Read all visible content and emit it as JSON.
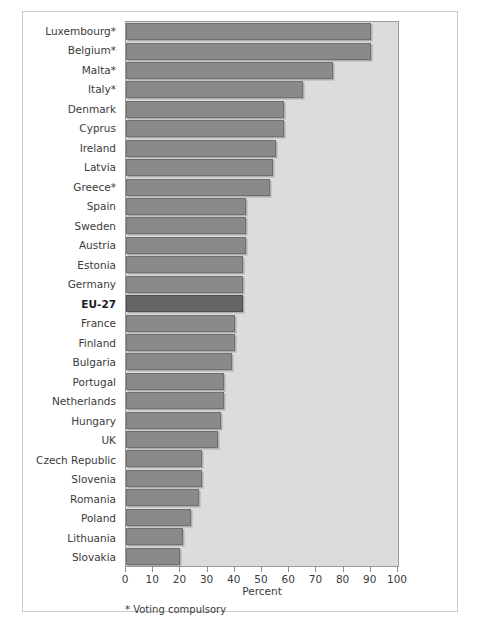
{
  "chart_data": {
    "type": "bar",
    "orientation": "horizontal",
    "title": "",
    "xlabel": "Percent",
    "ylabel": "",
    "xlim": [
      0,
      100
    ],
    "xticks": [
      0,
      10,
      20,
      30,
      40,
      50,
      60,
      70,
      80,
      90,
      100
    ],
    "grid": false,
    "legend": false,
    "footnote": "* Voting compulsory",
    "highlight_category": "EU-27",
    "colors": {
      "bar": "#8a8a8a",
      "bar_edge": "#6f6f6f",
      "highlight_bar": "#666666",
      "highlight_bar_edge": "#4e4e4e",
      "plot_background": "#dcdcdc",
      "figure_background": "#ffffff",
      "frame_border": "#c9c9c9",
      "text": "#3b3b3b"
    },
    "categories": [
      "Luxembourg*",
      "Belgium*",
      "Malta*",
      "Italy*",
      "Denmark",
      "Cyprus",
      "Ireland",
      "Latvia",
      "Greece*",
      "Spain",
      "Sweden",
      "Austria",
      "Estonia",
      "Germany",
      "EU-27",
      "France",
      "Finland",
      "Bulgaria",
      "Portugal",
      "Netherlands",
      "Hungary",
      "UK",
      "Czech Republic",
      "Slovenia",
      "Romania",
      "Poland",
      "Lithuania",
      "Slovakia"
    ],
    "values": [
      90,
      90,
      76,
      65,
      58,
      58,
      55,
      54,
      53,
      44,
      44,
      44,
      43,
      43,
      43,
      40,
      40,
      39,
      36,
      36,
      35,
      34,
      28,
      28,
      27,
      24,
      21,
      20
    ]
  }
}
